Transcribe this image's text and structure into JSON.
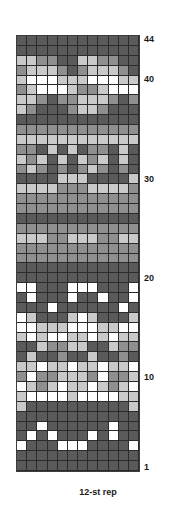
{
  "chart_data": {
    "type": "heatmap",
    "title": "",
    "subtitle": "",
    "xlabel": "",
    "ylabel": "",
    "caption": "12-st rep",
    "grid": true,
    "legend_position": "none",
    "columns": 12,
    "rows": 44,
    "x": [
      1,
      2,
      3,
      4,
      5,
      6,
      7,
      8,
      9,
      10,
      11,
      12
    ],
    "row_numbers": [
      1,
      10,
      20,
      30,
      40,
      44
    ],
    "row_label_positions": {
      "1": 1,
      "10": 10,
      "20": 20,
      "30": 30,
      "40": 40,
      "44": 44
    },
    "color_keys": [
      "D",
      "M",
      "L",
      "W"
    ],
    "color_names": [
      "dark-gray",
      "medium-gray",
      "light-gray",
      "white"
    ],
    "colors": {
      "D": "#5a5a5a",
      "M": "#8f8f8f",
      "L": "#c9c9c9",
      "W": "#ffffff"
    },
    "grid_line_color": "#2b2b2b",
    "text_color": "#1a1a1a",
    "background_color": "#ffffff",
    "values_note": "rows listed bottom (row 1) to top (row 44); each string is 12 stitches left to right",
    "rows_bottom_to_top": [
      "DDDDDDDDDDDD",
      "DDDDDDDDDDDD",
      "WDDDWWWDDDDW",
      "DWDWDDDWDWDD",
      "DDWDDDDDDWDD",
      "DDDDDDDDDDDD",
      "LDDDDDDDDDDL",
      "LWWWWLWWWWLL",
      "WLMLWLLWLMLW",
      "MWMMLLLMWMML",
      "LLWLLWLLWLLW",
      "DLDDMDDLDDMD",
      "DDLMMLLDDLMM",
      "LWLWWLLWLWLL",
      "WWLLLWWWLLWW",
      "WLDDDLWLDDDL",
      "DDDWDDDDDDWD",
      "DWDDDWDDWDDW",
      "WWDDDWWWDDDW",
      "DDDDDDDDDDDD",
      "DDDDDDDDDDDD",
      "MMMMMMMMMMMM",
      "MMMMMMMMMMMM",
      "LLLMMLLLMMLL",
      "MMMMMMMMMMMM",
      "DDDDDDDDDDDD",
      "MMMMMMMMMMMM",
      "MMMMMMMMMMMM",
      "LLLLMMMLLLLM",
      "DDDDLLLDDDDL",
      "MLMDMDMLMDMD",
      "LMLDLDLMLDLD",
      "MMDLDLDMMDLD",
      "LLLLLLLLLLLL",
      "MMMMMMMMMMMM",
      "DDDDDDDDDDDD",
      "LMDDDMLLMDDD",
      "LLMDMMLLLMDM",
      "MLWWWLMMLWWW",
      "LWWWLLLWWWLL",
      "MLLLMDMLLLMD",
      "LLMMDDLLMMDD",
      "DDDDDDDDDDDD",
      "DDDDDDDDDDDD"
    ]
  }
}
